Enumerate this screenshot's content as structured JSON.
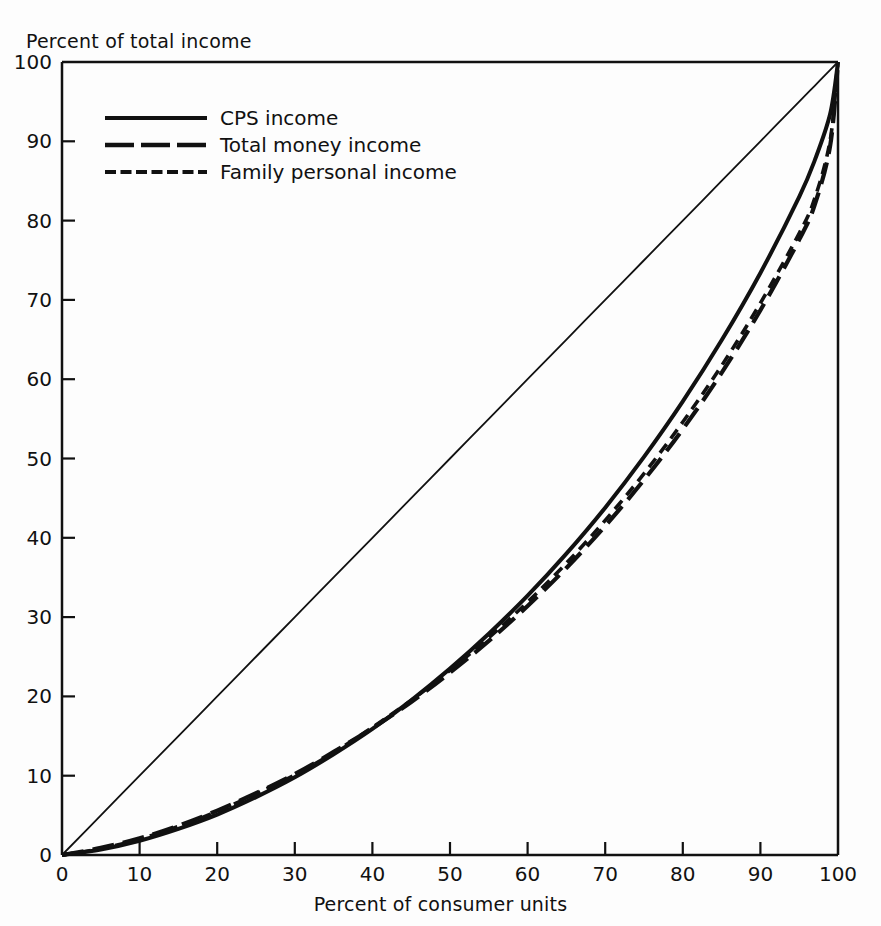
{
  "chart_data": {
    "type": "line",
    "title": "",
    "xlabel": "Percent of consumer units",
    "ylabel": "Percent of total income",
    "xlim": [
      0,
      100
    ],
    "ylim": [
      0,
      100
    ],
    "xticks": [
      0,
      10,
      20,
      30,
      40,
      50,
      60,
      70,
      80,
      90,
      100
    ],
    "yticks": [
      0,
      10,
      20,
      30,
      40,
      50,
      60,
      70,
      80,
      90,
      100
    ],
    "grid": false,
    "legend_position": "upper-left-inside",
    "x": [
      0,
      5,
      10,
      15,
      20,
      25,
      30,
      35,
      40,
      45,
      50,
      55,
      60,
      65,
      70,
      75,
      80,
      85,
      90,
      95,
      97,
      99,
      100
    ],
    "series": [
      {
        "name": "CPS income",
        "style": "solid",
        "values": [
          0,
          0.7,
          1.8,
          3.3,
          5.1,
          7.3,
          9.8,
          12.7,
          15.9,
          19.5,
          23.5,
          27.9,
          32.7,
          38.0,
          43.8,
          50.2,
          57.2,
          64.9,
          73.4,
          83.0,
          87.6,
          93.5,
          100
        ]
      },
      {
        "name": "Total money income",
        "style": "long-dash",
        "values": [
          0,
          0.9,
          2.1,
          3.7,
          5.6,
          7.8,
          10.2,
          13.0,
          16.0,
          19.3,
          23.0,
          27.0,
          31.4,
          36.2,
          41.5,
          47.3,
          53.7,
          60.8,
          68.7,
          77.6,
          82.0,
          89.5,
          100
        ]
      },
      {
        "name": "Family personal income",
        "style": "short-dash",
        "values": [
          0,
          0.8,
          2.0,
          3.6,
          5.5,
          7.7,
          10.1,
          12.9,
          16.1,
          19.5,
          23.3,
          27.4,
          31.9,
          36.8,
          42.2,
          48.1,
          54.6,
          61.7,
          69.6,
          78.4,
          82.8,
          90.2,
          100
        ]
      },
      {
        "name": "Line of equality",
        "style": "thin-solid",
        "values": [
          0,
          5,
          10,
          15,
          20,
          25,
          30,
          35,
          40,
          45,
          50,
          55,
          60,
          65,
          70,
          75,
          80,
          85,
          90,
          95,
          97,
          99,
          100
        ]
      }
    ],
    "legend": [
      {
        "label": "CPS income",
        "style": "solid"
      },
      {
        "label": "Total money income",
        "style": "long-dash"
      },
      {
        "label": "Family personal income",
        "style": "short-dash"
      }
    ],
    "colors": {
      "ink": "#111111",
      "background": "#ffffff"
    }
  }
}
